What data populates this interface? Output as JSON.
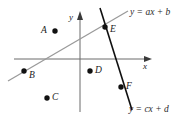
{
  "figure": {
    "type": "coordinate-plane-two-lines",
    "background_color": "#ffffff",
    "width": 191,
    "height": 124,
    "axes": {
      "x_axis_label": "x",
      "y_axis_label": "y",
      "origin_px": [
        80,
        59
      ],
      "x_axis_color": "#6b6b6b",
      "y_axis_color": "#6b6b6b"
    },
    "lines": [
      {
        "name": "line-ascending",
        "equation_label": "y = ax + b",
        "color": "#9a9a9a",
        "slope_sign": "positive"
      },
      {
        "name": "line-descending",
        "equation_label": "y = cx + d",
        "color": "#101010",
        "slope_sign": "negative-steep"
      }
    ],
    "points": [
      {
        "id": "A",
        "label": "A",
        "label_side": "left",
        "x": 55,
        "y": 31
      },
      {
        "id": "B",
        "label": "B",
        "label_side": "right",
        "x": 24,
        "y": 71
      },
      {
        "id": "C",
        "label": "C",
        "label_side": "right",
        "x": 47,
        "y": 98
      },
      {
        "id": "D",
        "label": "D",
        "label_side": "right",
        "x": 90,
        "y": 71
      },
      {
        "id": "E",
        "label": "E",
        "label_side": "right",
        "x": 105,
        "y": 27
      },
      {
        "id": "F",
        "label": "F",
        "label_side": "right",
        "x": 121,
        "y": 87
      }
    ]
  }
}
